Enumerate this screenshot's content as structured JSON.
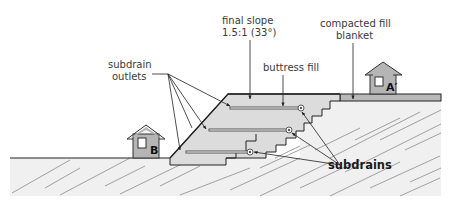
{
  "diagram": {
    "type": "cross-section",
    "labels": {
      "final_slope_line1": "final slope",
      "final_slope_line2": "1.5:1 (33°)",
      "compacted_fill_line1": "compacted fill",
      "compacted_fill_line2": "blanket",
      "subdrain_outlets_line1": "subdrain",
      "subdrain_outlets_line2": "outlets",
      "buttress_fill": "buttress fill",
      "subdrains": "subdrains"
    },
    "houses": [
      {
        "id": "B",
        "label": "B"
      },
      {
        "id": "A-prime",
        "label": "A′"
      }
    ],
    "colors": {
      "ground": "#f0f0f0",
      "fill": "#dcdcdc",
      "blanket": "#b9b9b9",
      "house": "#b5b5b5",
      "line": "#222222",
      "hatch": "#8a8a8a"
    }
  }
}
